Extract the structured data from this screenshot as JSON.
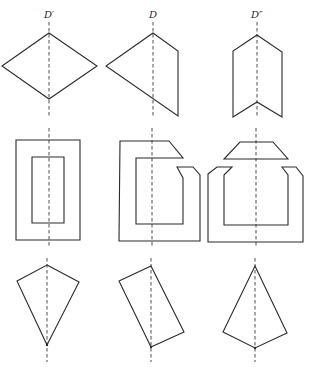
{
  "diagram": {
    "type": "symmetry-axis-figures",
    "stroke_color": "#2a2a2a",
    "background": "#ffffff",
    "columns": [
      {
        "label": "D′",
        "axis_x": 49
      },
      {
        "label": "D",
        "axis_x": 153
      },
      {
        "label": "D″",
        "axis_x": 256
      }
    ],
    "rows": [
      {
        "name": "row-1",
        "figures": [
          {
            "name": "diamond",
            "points": "49,33 97,66 49,99 2,66"
          },
          {
            "name": "half-diamond-pentagon",
            "points": "153,33 178,51 178,116 106,66"
          },
          {
            "name": "chevron-hexagon",
            "points": "257,35 282,52 282,117 257,102 233,117 233,51"
          }
        ]
      },
      {
        "name": "row-2",
        "figures": [
          {
            "name": "frame-outer",
            "points": "16,140 80,140 80,240 16,240"
          },
          {
            "name": "frame-inner",
            "points": "32,157 64,157 64,223 32,223"
          },
          {
            "name": "split-frame",
            "points": "120,141 169,141 183,158 136,158 136,224 183,224 183,178 177,167 193,167 200,175 200,241 119,241"
          },
          {
            "name": "trapezoid-cap",
            "points": "240,142 273,142 288,159 224,159"
          },
          {
            "name": "open-u-frame",
            "points": "208,174 217,167 232,167 224,175 224,225 288,225 288,175 282,167 296,167 303,176 303,242 208,242"
          }
        ]
      },
      {
        "name": "row-3",
        "figures": [
          {
            "name": "kite",
            "points": "47,265 79,282 47,345 17,281"
          },
          {
            "name": "tilted-rectangle",
            "points": "151,266 184,332 151,347 119,281"
          },
          {
            "name": "inverted-kite",
            "points": "255,266 287,333 255,348 223,332"
          }
        ]
      }
    ]
  }
}
